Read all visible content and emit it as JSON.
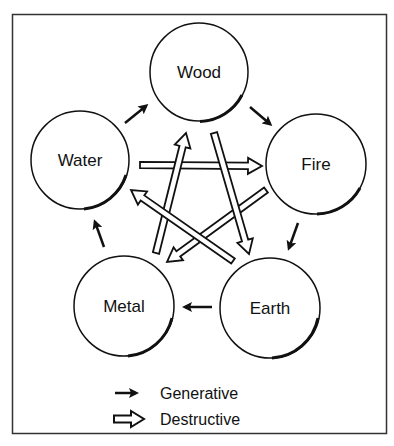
{
  "diagram": {
    "elements": [
      {
        "id": "wood",
        "label": "Wood"
      },
      {
        "id": "fire",
        "label": "Fire"
      },
      {
        "id": "earth",
        "label": "Earth"
      },
      {
        "id": "metal",
        "label": "Metal"
      },
      {
        "id": "water",
        "label": "Water"
      }
    ],
    "generative_cycle": [
      {
        "from": "water",
        "to": "wood"
      },
      {
        "from": "wood",
        "to": "fire"
      },
      {
        "from": "fire",
        "to": "earth"
      },
      {
        "from": "earth",
        "to": "metal"
      },
      {
        "from": "metal",
        "to": "water"
      }
    ],
    "destructive_cycle": [
      {
        "from": "water",
        "to": "fire"
      },
      {
        "from": "fire",
        "to": "metal"
      },
      {
        "from": "metal",
        "to": "wood"
      },
      {
        "from": "wood",
        "to": "earth"
      },
      {
        "from": "earth",
        "to": "water"
      }
    ]
  },
  "legend": {
    "generative_label": "Generative",
    "destructive_label": "Destructive"
  },
  "colors": {
    "stroke": "#111111",
    "fill": "#ffffff"
  }
}
